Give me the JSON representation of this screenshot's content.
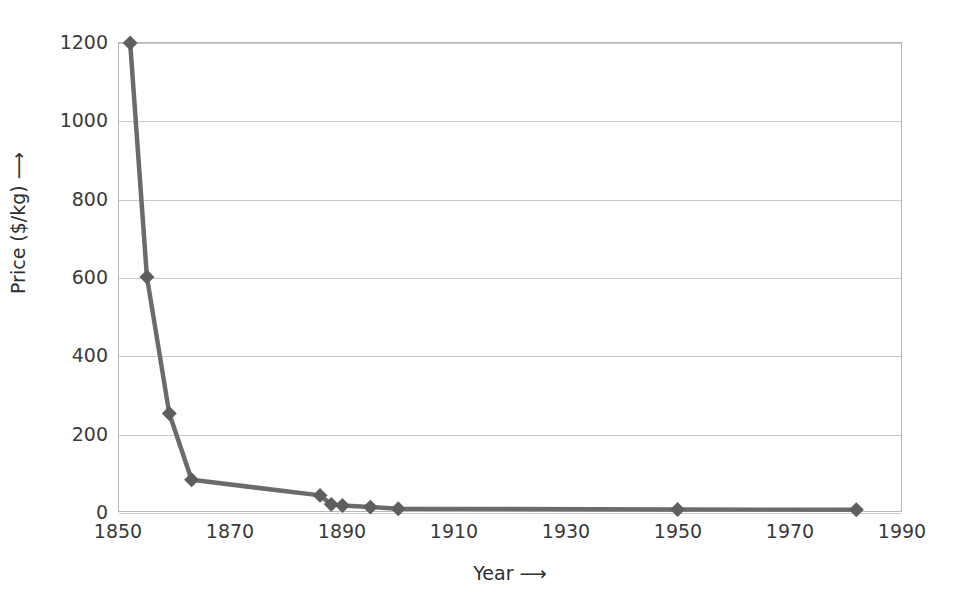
{
  "chart_data": {
    "type": "line",
    "title": "",
    "xlabel": "Year  ⟶",
    "ylabel": "Price ($/kg)  ⟶",
    "xlim": [
      1850,
      1990
    ],
    "ylim": [
      0,
      1200
    ],
    "grid": true,
    "legend": "none",
    "marker": "diamond",
    "line_color": "#6b6b6b",
    "marker_color": "#5e5e5e",
    "grid_color": "#c9c9c9",
    "frame_color": "#b8b8b8",
    "xticks": [
      1850,
      1870,
      1890,
      1910,
      1930,
      1950,
      1970,
      1990
    ],
    "xtick_labels": [
      "1850",
      "1870",
      "1890",
      "1910",
      "1930",
      "1950",
      "1970",
      "1990"
    ],
    "yticks": [
      0,
      200,
      400,
      600,
      800,
      1000,
      1200
    ],
    "ytick_labels": [
      "0",
      "200",
      "400",
      "600",
      "800",
      "1000",
      "1200"
    ],
    "series": [
      {
        "name": "Price of aluminium",
        "x": [
          1852,
          1855,
          1859,
          1863,
          1886,
          1888,
          1890,
          1895,
          1900,
          1950,
          1982
        ],
        "y": [
          1200,
          600,
          250,
          80,
          40,
          17,
          14,
          10,
          6,
          4,
          3
        ]
      }
    ],
    "points": [
      {
        "year": 1852,
        "price": 1200
      },
      {
        "year": 1855,
        "price": 600
      },
      {
        "year": 1859,
        "price": 250
      },
      {
        "year": 1863,
        "price": 80
      },
      {
        "year": 1886,
        "price": 40
      },
      {
        "year": 1888,
        "price": 17
      },
      {
        "year": 1890,
        "price": 14
      },
      {
        "year": 1895,
        "price": 10
      },
      {
        "year": 1900,
        "price": 6
      },
      {
        "year": 1950,
        "price": 4
      },
      {
        "year": 1982,
        "price": 3
      }
    ]
  }
}
